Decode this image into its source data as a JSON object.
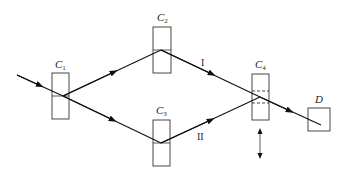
{
  "diagram": {
    "components": [
      {
        "id": "C1",
        "letter": "C",
        "sub": "1"
      },
      {
        "id": "C2",
        "letter": "C",
        "sub": "2"
      },
      {
        "id": "C3",
        "letter": "C",
        "sub": "3"
      },
      {
        "id": "C4",
        "letter": "C",
        "sub": "4"
      }
    ],
    "detector": {
      "label": "D"
    },
    "paths": [
      {
        "label": "I"
      },
      {
        "label": "II"
      }
    ],
    "colors": {
      "line": "#111111",
      "background": "#ffffff"
    }
  }
}
